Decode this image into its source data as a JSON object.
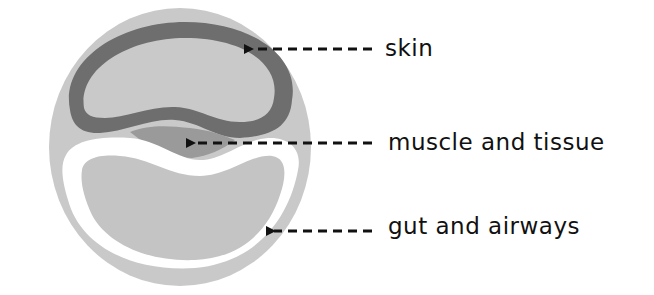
{
  "diagram": {
    "colors": {
      "background": "#ffffff",
      "outer_body": "#c9c9c9",
      "skin": "#6e6e6e",
      "muscle_and_tissue": "#9a9a9a",
      "gut_lining": "#ffffff",
      "gut_and_airways": "#c4c4c4",
      "arrow": "#111111",
      "text": "#111111"
    },
    "labels": [
      {
        "id": "skin",
        "text": "skin"
      },
      {
        "id": "muscle",
        "text": "muscle and tissue"
      },
      {
        "id": "gut",
        "text": "gut and airways"
      }
    ]
  }
}
